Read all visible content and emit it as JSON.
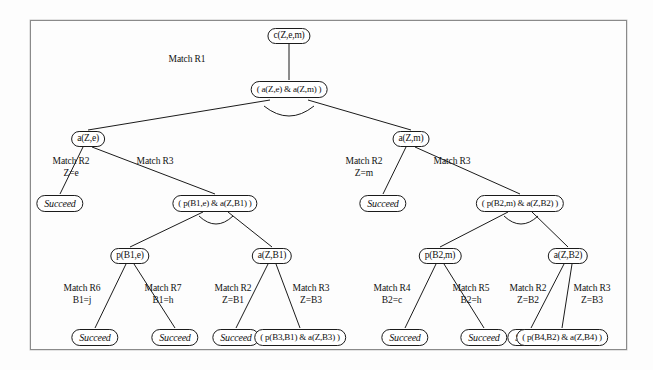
{
  "figure": {
    "frame_color": "#8a8a8a",
    "node_border_color": "#1b1b1b",
    "edge_color": "#1b1b1b",
    "succeed_label": "Succeed"
  },
  "nodes": {
    "root": {
      "text": "c(Z,e,m)",
      "type": "goal"
    },
    "conj_top": {
      "text": "( a(Z,e) & a(Z,m) )",
      "type": "conj"
    },
    "a_Z_e": {
      "text": "a(Z,e)",
      "type": "goal"
    },
    "a_Z_m": {
      "text": "a(Z,m)",
      "type": "goal"
    },
    "succeed_l1": {
      "text": "Succeed",
      "type": "succeed"
    },
    "succeed_r1": {
      "text": "Succeed",
      "type": "succeed"
    },
    "conj_left": {
      "text": "( p(B1,e) & a(Z,B1) )",
      "type": "conj"
    },
    "conj_right": {
      "text": "( p(B2,m) & a(Z,B2) )",
      "type": "conj"
    },
    "p_B1_e": {
      "text": "p(B1,e)",
      "type": "goal"
    },
    "a_Z_B1": {
      "text": "a(Z,B1)",
      "type": "goal"
    },
    "p_B2_m": {
      "text": "p(B2,m)",
      "type": "goal"
    },
    "a_Z_B2": {
      "text": "a(Z,B2)",
      "type": "goal"
    },
    "succeed_b1": {
      "text": "Succeed",
      "type": "succeed"
    },
    "succeed_b2": {
      "text": "Succeed",
      "type": "succeed"
    },
    "succeed_b3": {
      "text": "Succeed",
      "type": "succeed"
    },
    "succeed_b4": {
      "text": "Succeed",
      "type": "succeed"
    },
    "succeed_b5": {
      "text": "Succeed",
      "type": "succeed"
    },
    "succeed_b6": {
      "text": "Succeed",
      "type": "succeed"
    },
    "conj_b_left": {
      "text": "( p(B3,B1) & a(Z,B3) )",
      "type": "conj"
    },
    "conj_b_right": {
      "text": "( p(B4,B2) & a(Z,B4) )",
      "type": "conj"
    }
  },
  "edge_labels": {
    "root_r1": {
      "rule": "Match R1",
      "binding": ""
    },
    "aze_r2": {
      "rule": "Match R2",
      "binding": "Z=e"
    },
    "aze_r3": {
      "rule": "Match R3",
      "binding": ""
    },
    "azm_r2": {
      "rule": "Match R2",
      "binding": "Z=m"
    },
    "azm_r3": {
      "rule": "Match R3",
      "binding": ""
    },
    "pb1e_r6": {
      "rule": "Match R6",
      "binding": "B1=j"
    },
    "pb1e_r7": {
      "rule": "Match R7",
      "binding": "B1=h"
    },
    "azb1_r2": {
      "rule": "Match R2",
      "binding": "Z=B1"
    },
    "azb1_r3": {
      "rule": "Match R3",
      "binding": "Z=B3"
    },
    "pb2m_r4": {
      "rule": "Match R4",
      "binding": "B2=c"
    },
    "pb2m_r5": {
      "rule": "Match R5",
      "binding": "B2=h"
    },
    "azb2_r2": {
      "rule": "Match R2",
      "binding": "Z=B2"
    },
    "azb2_r3": {
      "rule": "Match R3",
      "binding": "Z=B3"
    }
  }
}
